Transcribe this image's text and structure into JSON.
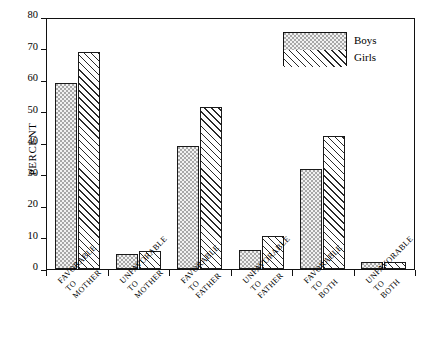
{
  "chart_data": {
    "type": "bar",
    "title": "",
    "xlabel": "",
    "ylabel": "PERCENT",
    "ylim": [
      0,
      80
    ],
    "yticks": [
      0,
      10,
      20,
      30,
      40,
      50,
      60,
      70,
      80
    ],
    "grid": false,
    "legend_position": "top-right",
    "categories": [
      "FAVORABLE TO MOTHER",
      "UNFAVORABLE TO MOTHER",
      "FAVORABLE TO FATHER",
      "UNFAVORABLE TO FATHER",
      "FAVORABLE TO BOTH",
      "UNFAVORABLE TO BOTH"
    ],
    "category_lines": [
      [
        "FAVORABLE",
        "TO",
        "MOTHER"
      ],
      [
        "UNFAVORABLE",
        "TO",
        "MOTHER"
      ],
      [
        "FAVORABLE",
        "TO",
        "FATHER"
      ],
      [
        "UNFAVORABLE",
        "TO",
        "FATHER"
      ],
      [
        "FAVORABLE",
        "TO",
        "BOTH"
      ],
      [
        "UNFAVORABLE",
        "TO",
        "BOTH"
      ]
    ],
    "series": [
      {
        "name": "Boys",
        "fill": "checkerboard-gray",
        "values": [
          59.5,
          4.8,
          39.5,
          6.0,
          32.0,
          2.2
        ]
      },
      {
        "name": "Girls",
        "fill": "diagonal-hatch",
        "values": [
          69.5,
          5.8,
          52.0,
          10.5,
          42.5,
          2.2
        ]
      }
    ]
  },
  "legend": {
    "boys_label": "Boys",
    "girls_label": "Girls"
  },
  "colors": {
    "boys_fill": "#a8a8a8",
    "girls_fill": "#ffffff",
    "outline": "#1a1a1a",
    "background": "#ffffff"
  }
}
